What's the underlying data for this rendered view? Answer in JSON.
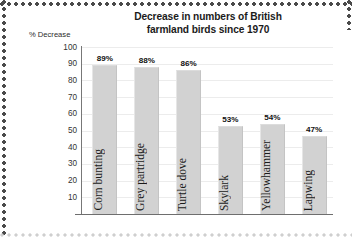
{
  "chart_data": {
    "type": "bar",
    "title": "Decrease in numbers of British farmland birds since 1970",
    "title_lines": [
      "Decrease in numbers of British",
      "farmland birds since 1970"
    ],
    "ylabel": "% Decrease",
    "xlabel": "",
    "categories": [
      "Corn bunting",
      "Grey partridge",
      "Turtle dove",
      "Skylark",
      "Yellowhammer",
      "Lapwing"
    ],
    "values": [
      89,
      88,
      86,
      53,
      54,
      47
    ],
    "value_labels": [
      "89%",
      "88%",
      "86%",
      "53%",
      "54%",
      "47%"
    ],
    "ylim": [
      0,
      100
    ],
    "yticks": [
      100,
      90,
      80,
      70,
      60,
      50,
      40,
      30,
      20,
      10
    ],
    "ytick_labels": [
      "100",
      "90",
      "80",
      "70",
      "60",
      "50",
      "40",
      "30",
      "20",
      "10"
    ],
    "grid": true,
    "legend": false,
    "bar_color": "#d2d2d2",
    "axis_color": "#6e6e6e",
    "grid_color": "#ececec",
    "text_color": "#1b1b1b"
  }
}
